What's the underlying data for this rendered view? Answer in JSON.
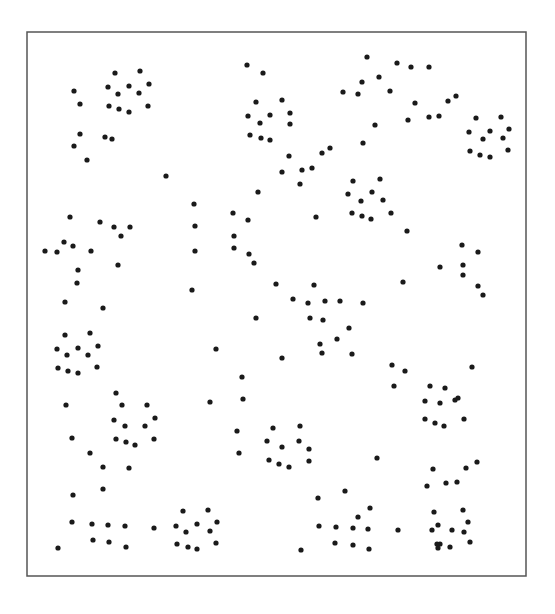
{
  "chart_data": {
    "type": "scatter",
    "title": "",
    "xlabel": "",
    "ylabel": "",
    "grid": false,
    "legend": null,
    "frame": {
      "x": 27,
      "y": 32,
      "width": 499,
      "height": 544,
      "stroke": "#555555"
    },
    "marker": {
      "radius": 2.6,
      "color": "#1a1a1a"
    },
    "points": [
      [
        74,
        91
      ],
      [
        80,
        104
      ],
      [
        115,
        73
      ],
      [
        140,
        71
      ],
      [
        108,
        87
      ],
      [
        118,
        94
      ],
      [
        129,
        86
      ],
      [
        149,
        84
      ],
      [
        139,
        93
      ],
      [
        109,
        106
      ],
      [
        119,
        109
      ],
      [
        129,
        112
      ],
      [
        148,
        106
      ],
      [
        80,
        134
      ],
      [
        74,
        146
      ],
      [
        87,
        160
      ],
      [
        105,
        137
      ],
      [
        112,
        139
      ],
      [
        166,
        176
      ],
      [
        247,
        65
      ],
      [
        263,
        73
      ],
      [
        256,
        102
      ],
      [
        282,
        100
      ],
      [
        248,
        116
      ],
      [
        260,
        123
      ],
      [
        270,
        115
      ],
      [
        290,
        113
      ],
      [
        250,
        135
      ],
      [
        261,
        138
      ],
      [
        270,
        140
      ],
      [
        290,
        124
      ],
      [
        289,
        156
      ],
      [
        282,
        172
      ],
      [
        302,
        170
      ],
      [
        312,
        168
      ],
      [
        322,
        153
      ],
      [
        330,
        148
      ],
      [
        367,
        57
      ],
      [
        397,
        63
      ],
      [
        411,
        67
      ],
      [
        429,
        67
      ],
      [
        362,
        82
      ],
      [
        379,
        77
      ],
      [
        343,
        92
      ],
      [
        358,
        94
      ],
      [
        390,
        91
      ],
      [
        375,
        125
      ],
      [
        363,
        143
      ],
      [
        415,
        103
      ],
      [
        408,
        120
      ],
      [
        429,
        117
      ],
      [
        439,
        116
      ],
      [
        448,
        101
      ],
      [
        456,
        96
      ],
      [
        476,
        118
      ],
      [
        501,
        117
      ],
      [
        469,
        132
      ],
      [
        490,
        131
      ],
      [
        509,
        129
      ],
      [
        483,
        139
      ],
      [
        503,
        138
      ],
      [
        470,
        151
      ],
      [
        480,
        155
      ],
      [
        490,
        157
      ],
      [
        508,
        150
      ],
      [
        258,
        192
      ],
      [
        300,
        184
      ],
      [
        353,
        181
      ],
      [
        380,
        179
      ],
      [
        348,
        194
      ],
      [
        372,
        192
      ],
      [
        361,
        201
      ],
      [
        383,
        200
      ],
      [
        352,
        213
      ],
      [
        362,
        216
      ],
      [
        371,
        219
      ],
      [
        391,
        213
      ],
      [
        407,
        231
      ],
      [
        70,
        217
      ],
      [
        100,
        222
      ],
      [
        114,
        227
      ],
      [
        130,
        227
      ],
      [
        121,
        236
      ],
      [
        64,
        242
      ],
      [
        73,
        246
      ],
      [
        57,
        252
      ],
      [
        45,
        251
      ],
      [
        91,
        251
      ],
      [
        78,
        270
      ],
      [
        118,
        265
      ],
      [
        77,
        283
      ],
      [
        65,
        302
      ],
      [
        103,
        308
      ],
      [
        194,
        204
      ],
      [
        195,
        226
      ],
      [
        195,
        251
      ],
      [
        192,
        290
      ],
      [
        233,
        213
      ],
      [
        248,
        220
      ],
      [
        234,
        236
      ],
      [
        234,
        248
      ],
      [
        249,
        254
      ],
      [
        254,
        263
      ],
      [
        276,
        284
      ],
      [
        256,
        318
      ],
      [
        316,
        217
      ],
      [
        462,
        245
      ],
      [
        478,
        252
      ],
      [
        440,
        267
      ],
      [
        463,
        265
      ],
      [
        463,
        275
      ],
      [
        478,
        286
      ],
      [
        483,
        295
      ],
      [
        403,
        282
      ],
      [
        314,
        285
      ],
      [
        293,
        299
      ],
      [
        308,
        303
      ],
      [
        325,
        301
      ],
      [
        340,
        301
      ],
      [
        363,
        303
      ],
      [
        310,
        318
      ],
      [
        323,
        320
      ],
      [
        337,
        339
      ],
      [
        349,
        328
      ],
      [
        320,
        344
      ],
      [
        322,
        353
      ],
      [
        352,
        354
      ],
      [
        392,
        365
      ],
      [
        65,
        335
      ],
      [
        90,
        333
      ],
      [
        57,
        349
      ],
      [
        67,
        355
      ],
      [
        78,
        348
      ],
      [
        88,
        355
      ],
      [
        98,
        346
      ],
      [
        58,
        368
      ],
      [
        68,
        371
      ],
      [
        78,
        373
      ],
      [
        97,
        367
      ],
      [
        216,
        349
      ],
      [
        282,
        358
      ],
      [
        242,
        377
      ],
      [
        243,
        399
      ],
      [
        210,
        402
      ],
      [
        394,
        386
      ],
      [
        405,
        371
      ],
      [
        116,
        393
      ],
      [
        122,
        405
      ],
      [
        147,
        405
      ],
      [
        114,
        420
      ],
      [
        125,
        426
      ],
      [
        145,
        426
      ],
      [
        155,
        418
      ],
      [
        116,
        439
      ],
      [
        126,
        442
      ],
      [
        135,
        445
      ],
      [
        154,
        439
      ],
      [
        66,
        405
      ],
      [
        72,
        438
      ],
      [
        90,
        453
      ],
      [
        103,
        467
      ],
      [
        129,
        468
      ],
      [
        237,
        431
      ],
      [
        239,
        453
      ],
      [
        273,
        428
      ],
      [
        300,
        426
      ],
      [
        267,
        441
      ],
      [
        282,
        447
      ],
      [
        299,
        441
      ],
      [
        309,
        449
      ],
      [
        269,
        460
      ],
      [
        279,
        464
      ],
      [
        289,
        467
      ],
      [
        309,
        461
      ],
      [
        377,
        458
      ],
      [
        430,
        386
      ],
      [
        445,
        388
      ],
      [
        455,
        400
      ],
      [
        472,
        367
      ],
      [
        425,
        401
      ],
      [
        440,
        403
      ],
      [
        458,
        398
      ],
      [
        425,
        419
      ],
      [
        435,
        423
      ],
      [
        444,
        426
      ],
      [
        464,
        419
      ],
      [
        433,
        469
      ],
      [
        477,
        462
      ],
      [
        427,
        486
      ],
      [
        446,
        483
      ],
      [
        457,
        482
      ],
      [
        466,
        468
      ],
      [
        345,
        491
      ],
      [
        318,
        498
      ],
      [
        370,
        508
      ],
      [
        463,
        510
      ],
      [
        434,
        512
      ],
      [
        468,
        522
      ],
      [
        438,
        525
      ],
      [
        464,
        532
      ],
      [
        452,
        530
      ],
      [
        470,
        542
      ],
      [
        440,
        544
      ],
      [
        450,
        547
      ],
      [
        438,
        548
      ],
      [
        432,
        530
      ],
      [
        437,
        544
      ],
      [
        73,
        495
      ],
      [
        103,
        489
      ],
      [
        72,
        522
      ],
      [
        92,
        524
      ],
      [
        108,
        525
      ],
      [
        125,
        526
      ],
      [
        93,
        540
      ],
      [
        109,
        542
      ],
      [
        126,
        547
      ],
      [
        58,
        548
      ],
      [
        154,
        528
      ],
      [
        183,
        511
      ],
      [
        208,
        510
      ],
      [
        176,
        526
      ],
      [
        197,
        524
      ],
      [
        186,
        532
      ],
      [
        217,
        522
      ],
      [
        210,
        531
      ],
      [
        177,
        544
      ],
      [
        188,
        547
      ],
      [
        197,
        549
      ],
      [
        216,
        543
      ],
      [
        319,
        526
      ],
      [
        336,
        527
      ],
      [
        353,
        528
      ],
      [
        368,
        529
      ],
      [
        398,
        530
      ],
      [
        335,
        543
      ],
      [
        353,
        545
      ],
      [
        369,
        549
      ],
      [
        301,
        550
      ],
      [
        358,
        517
      ]
    ]
  }
}
